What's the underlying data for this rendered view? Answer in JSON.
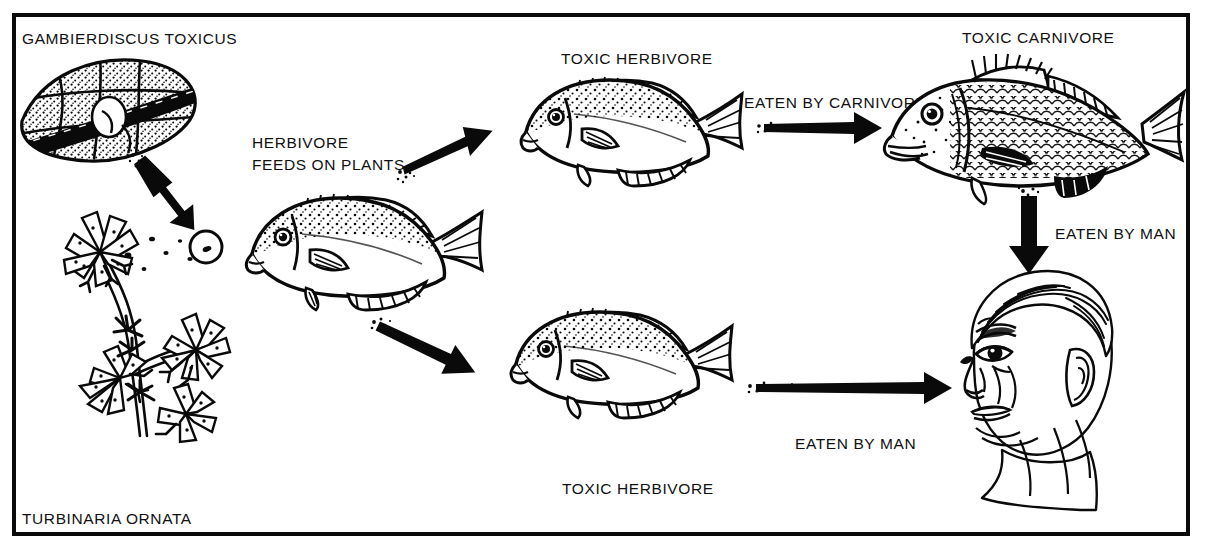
{
  "diagram": {
    "title_organisms": {
      "dinoflagellate": "GAMBIERDISCUS TOXICUS",
      "alga": "TURBINARIA ORNATA"
    },
    "labels": [
      {
        "id": "gambierdiscus",
        "text": "GAMBIERDISCUS TOXICUS"
      },
      {
        "id": "herbivore-feeds",
        "text": "HERBIVORE\nFEEDS ON PLANTS"
      },
      {
        "id": "toxic-herbivore-top",
        "text": "TOXIC HERBIVORE"
      },
      {
        "id": "eaten-by-carnivore",
        "text": "EATEN BY CARNIVORE"
      },
      {
        "id": "toxic-carnivore",
        "text": "TOXIC CARNIVORE"
      },
      {
        "id": "eaten-by-man-right",
        "text": "EATEN BY MAN"
      },
      {
        "id": "eaten-by-man-bottom",
        "text": "EATEN BY MAN"
      },
      {
        "id": "toxic-herbivore-bottom",
        "text": "TOXIC HERBIVORE"
      },
      {
        "id": "turbinaria",
        "text": "TURBINARIA ORNATA"
      }
    ],
    "organisms": [
      {
        "id": "dinoflagellate",
        "name": "Gambierdiscus toxicus",
        "role": "toxic dinoflagellate"
      },
      {
        "id": "alga",
        "name": "Turbinaria ornata",
        "role": "host macroalga"
      },
      {
        "id": "herbivore-fish",
        "name": "herbivorous fish",
        "role": "grazer"
      },
      {
        "id": "toxic-herbivore-top",
        "name": "toxic herbivore fish",
        "role": "toxin accumulator"
      },
      {
        "id": "toxic-herbivore-bottom",
        "name": "toxic herbivore fish",
        "role": "toxin accumulator"
      },
      {
        "id": "toxic-carnivore",
        "name": "toxic carnivorous fish",
        "role": "predator"
      },
      {
        "id": "man",
        "name": "human head",
        "role": "final consumer"
      }
    ],
    "arrows": [
      {
        "id": "arrow-dino-to-alga",
        "from": "dinoflagellate",
        "to": "alga",
        "direction": "down-right"
      },
      {
        "id": "arrow-herbivore-to-toxic-top",
        "from": "herbivore-fish",
        "to": "toxic-herbivore-top",
        "direction": "up-right"
      },
      {
        "id": "arrow-herbivore-to-toxic-bottom",
        "from": "herbivore-fish",
        "to": "toxic-herbivore-bottom",
        "direction": "down-right"
      },
      {
        "id": "arrow-to-carnivore",
        "from": "toxic-herbivore-top",
        "to": "toxic-carnivore",
        "direction": "right"
      },
      {
        "id": "arrow-carnivore-to-man",
        "from": "toxic-carnivore",
        "to": "man",
        "direction": "down"
      },
      {
        "id": "arrow-herbivore-to-man",
        "from": "toxic-herbivore-bottom",
        "to": "man",
        "direction": "right"
      }
    ],
    "colors": {
      "ink": "#0a0a0a",
      "paper": "#ffffff"
    }
  }
}
